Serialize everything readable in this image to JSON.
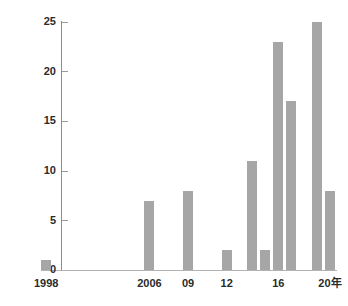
{
  "chart_data": {
    "type": "bar",
    "title": "",
    "subtitle": "",
    "xlabel": "年",
    "ylabel": "",
    "grid": false,
    "legend": "none",
    "ylim": [
      0,
      25
    ],
    "yticks": [
      0,
      5,
      10,
      15,
      20,
      25
    ],
    "ytick_labels": [
      "0",
      "5",
      "10",
      "15",
      "20",
      "25"
    ],
    "xlim": [
      1998,
      2020
    ],
    "xtick_labels": [
      "1998",
      "2006",
      "09",
      "12",
      "16",
      "20年"
    ],
    "xticks": [
      1998,
      2006,
      2009,
      2012,
      2016,
      2020
    ],
    "categories": [
      "1998",
      "1999",
      "2000",
      "2001",
      "2002",
      "2003",
      "2004",
      "2005",
      "2006",
      "2007",
      "2008",
      "2009",
      "2010",
      "2011",
      "2012",
      "2013",
      "2014",
      "2015",
      "2016",
      "2017",
      "2018",
      "2019",
      "2020"
    ],
    "values": [
      1,
      0,
      0,
      0,
      0,
      0,
      0,
      0,
      7,
      0,
      0,
      8,
      0,
      0,
      2,
      0,
      11,
      2,
      23,
      17,
      0,
      25,
      8
    ],
    "bar_color": "#a6a6a6",
    "axis_color": "#8d8d8d",
    "text_color": "#2b2b2b",
    "background": "#ffffff"
  },
  "axis": {
    "y_labels": [
      "25",
      "20",
      "15",
      "10",
      "5",
      "0"
    ],
    "x_labels": [
      {
        "text": "1998",
        "year": 1998
      },
      {
        "text": "2006",
        "year": 2006
      },
      {
        "text": "09",
        "year": 2009
      },
      {
        "text": "12",
        "year": 2012
      },
      {
        "text": "16",
        "year": 2016
      },
      {
        "text": "20年",
        "year": 2020
      }
    ]
  }
}
